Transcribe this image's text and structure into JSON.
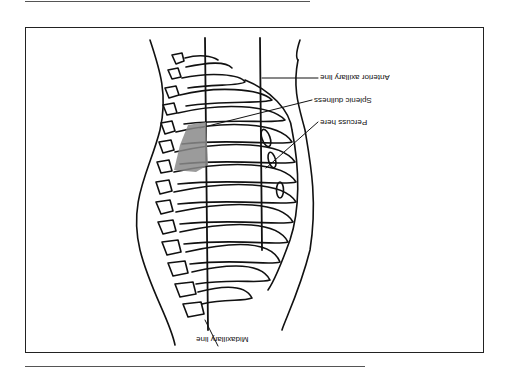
{
  "figure": {
    "orientation": "rotated-180",
    "labels": {
      "anterior_axillary_line": "Anterior axillary line",
      "splenic_dullness": "Splenic dullness",
      "percuss_here": "Percuss here",
      "midaxillary_line": "Midaxillary line"
    },
    "colors": {
      "line": "#111111",
      "shading": "#8a8a8a",
      "frame": "#222222",
      "background": "#ffffff"
    }
  }
}
